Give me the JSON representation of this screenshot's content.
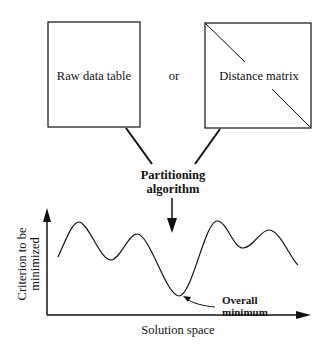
{
  "boxes": {
    "raw_data": {
      "label": "Raw data table"
    },
    "distance": {
      "label": "Distance matrix"
    }
  },
  "connector_or": "or",
  "algorithm": {
    "line1": "Partitioning",
    "line2": "algorithm"
  },
  "graph": {
    "y_label_line1": "Criterion to be",
    "y_label_line2": "minimized",
    "x_label": "Solution space",
    "annotation_line1": "Overall",
    "annotation_line2": "minimum"
  }
}
